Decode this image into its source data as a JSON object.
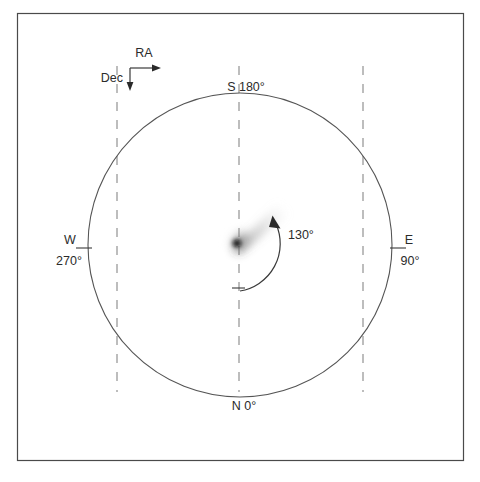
{
  "figure": {
    "type": "comet-position-angle-diagram",
    "background_color": "#ffffff",
    "frame": {
      "x": 17,
      "y": 13,
      "width": 447,
      "height": 448,
      "stroke_color": "#4a4a4a"
    },
    "sky_circle": {
      "center_x": 240,
      "center_y": 245,
      "radius": 152,
      "stroke_color": "#555555"
    }
  },
  "orientation_axes": {
    "ra_label": "RA",
    "dec_label": "Dec",
    "origin_x": 130,
    "origin_y": 68,
    "ra_arrow_end_x": 160,
    "dec_arrow_end_y": 90
  },
  "cardinal_labels": {
    "south": "S 180°",
    "north": "N 0°",
    "west_letter": "W",
    "west_angle": "270°",
    "east_letter": "E",
    "east_angle": "90°"
  },
  "position_angle": {
    "label": "130°",
    "value_degrees": 130,
    "arc_radius": 48,
    "start_angle_deg": 0,
    "end_angle_deg": 130,
    "label_x": 290,
    "label_y": 234
  },
  "comet": {
    "nucleus_x": 237,
    "nucleus_y": 243,
    "tail_tip_x": 276,
    "tail_tip_y": 207,
    "core_color": "#1a1a1a",
    "tail_color": "#8a8a8a"
  },
  "grid_lines": {
    "dash_color": "#9a9a9a",
    "x_positions": [
      117,
      239,
      363
    ],
    "y_top": 66,
    "y_bottom": 392
  }
}
